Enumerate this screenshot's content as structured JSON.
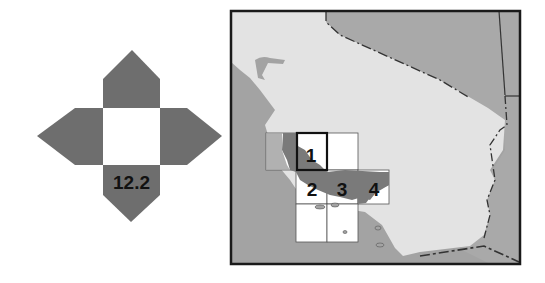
{
  "locator": {
    "page_label": "12.2",
    "colors": {
      "arrow": "#6e6e6e",
      "center": "#ffffff"
    }
  },
  "map": {
    "colors": {
      "land": "#e3e3e3",
      "ocean": "#a3a3a3",
      "neighbor_state": "#a9a9a9",
      "highlight": "#7a7a7a",
      "tile": "#ffffff",
      "frame": "#1a1a1a"
    },
    "tiles": [
      {
        "label": "1",
        "selected": true
      },
      {
        "label": "2",
        "selected": false
      },
      {
        "label": "3",
        "selected": false
      },
      {
        "label": "4",
        "selected": false
      }
    ]
  }
}
